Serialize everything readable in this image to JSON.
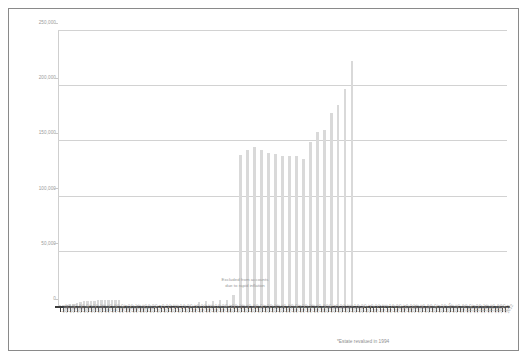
{
  "chart_data": {
    "type": "bar",
    "title": "",
    "subtitle": "",
    "xlabel": "",
    "ylabel": "",
    "ylim": [
      0,
      250000
    ],
    "grid": true,
    "legend_position": "none",
    "ytick_labels": [
      "250,000",
      "200,000",
      "150,000",
      "100,000",
      "50,000",
      "0"
    ],
    "ytick_values": [
      250000,
      200000,
      150000,
      100000,
      50000,
      0
    ],
    "annotations": [
      {
        "name": "excluded-years-note",
        "line1": "Excluded from accounts",
        "line2": "due to rapid inflation"
      },
      {
        "name": "revaluation-footnote",
        "text": "*Estate revalued in 1994"
      }
    ],
    "bar_color": "#d9d9d9",
    "gridline_color": "#d2d2d2",
    "axis_color": "#3b3b3b",
    "label_color": "#9a9a9a",
    "categories": [
      "1884",
      "1885",
      "1886",
      "1887",
      "1888",
      "1889",
      "1890",
      "1891",
      "1892",
      "1893",
      "1894",
      "1895",
      "1896",
      "1897",
      "1898",
      "1899",
      "1900",
      "1901",
      "1902",
      "1903",
      "1904",
      "1905",
      "1906",
      "1907",
      "1908",
      "1909",
      "1910",
      "1911",
      "1912",
      "1913",
      "1914",
      "1915",
      "1916",
      "1917",
      "1918",
      "1919",
      "1920",
      "1921",
      "1922",
      "1923",
      "1924",
      "1925",
      "1926",
      "1927",
      "1928",
      "1929",
      "1930",
      "1931",
      "1932",
      "1933",
      "1934",
      "1935",
      "1936",
      "1937",
      "1938",
      "1939",
      "1940",
      "1941",
      "1942",
      "1943",
      "1944",
      "1945",
      "1946",
      "1947",
      "1948",
      "1949",
      "1950",
      "1951",
      "1952",
      "1953",
      "1954",
      "1955",
      "1956",
      "1957",
      "1958",
      "1959",
      "1960",
      "1961",
      "1962",
      "1963",
      "1964",
      "1965",
      "1966",
      "1967",
      "1968",
      "1969",
      "1970",
      "1971",
      "1972",
      "1973",
      "1974",
      "1975",
      "1976",
      "1977",
      "1978",
      "1979",
      "1980",
      "1981",
      "1982",
      "1983",
      "1984",
      "1985",
      "1986",
      "1987",
      "1988",
      "1989",
      "1990",
      "1991",
      "1992",
      "1993",
      "1994*",
      "1995",
      "1996",
      "1997",
      "1998",
      "1999",
      "2000",
      "2001",
      "2002",
      "2003",
      "2004",
      "2005",
      "2006",
      "2007",
      "2008",
      "2009",
      "2010",
      "2011",
      "2012"
    ],
    "values": [
      300,
      500,
      700,
      1100,
      1600,
      2200,
      2800,
      3600,
      4200,
      4400,
      4900,
      4900,
      5300,
      5600,
      5800,
      5900,
      5700,
      5500,
      5900,
      null,
      null,
      null,
      null,
      null,
      null,
      null,
      null,
      null,
      null,
      null,
      null,
      null,
      null,
      null,
      null,
      null,
      null,
      null,
      null,
      null,
      null,
      null,
      null,
      null,
      null,
      null,
      null,
      null,
      null,
      null,
      3500,
      4100,
      4300,
      4800,
      5600,
      9800,
      137000,
      141000,
      144000,
      141000,
      139000,
      138000,
      136000,
      136000,
      136000,
      133000,
      149000,
      158000,
      159000,
      175000,
      182000,
      197000,
      222000,
      null,
      null,
      null,
      null,
      null,
      null,
      null,
      null,
      null,
      null,
      null,
      null,
      null,
      null,
      null,
      null,
      null,
      null,
      null,
      null,
      null,
      null,
      null,
      null,
      null,
      null,
      null,
      null,
      null,
      null,
      null,
      null,
      null,
      null,
      null,
      null,
      null,
      null,
      null,
      null,
      null,
      null,
      null,
      null,
      null,
      null,
      null,
      null,
      null,
      null,
      null,
      null,
      null,
      null,
      null,
      null
    ]
  },
  "bars": [
    {
      "i": 0,
      "v": 300
    },
    {
      "i": 1,
      "v": 500
    },
    {
      "i": 2,
      "v": 800
    },
    {
      "i": 3,
      "v": 1400
    },
    {
      "i": 4,
      "v": 2000
    },
    {
      "i": 5,
      "v": 2600
    },
    {
      "i": 6,
      "v": 3300
    },
    {
      "i": 7,
      "v": 4100
    },
    {
      "i": 8,
      "v": 4400
    },
    {
      "i": 9,
      "v": 4800
    },
    {
      "i": 10,
      "v": 4900
    },
    {
      "i": 11,
      "v": 5200
    },
    {
      "i": 12,
      "v": 5500
    },
    {
      "i": 13,
      "v": 5700
    },
    {
      "i": 14,
      "v": 5900
    },
    {
      "i": 15,
      "v": 5700
    },
    {
      "i": 16,
      "v": 5500
    },
    {
      "i": 17,
      "v": 5900
    },
    {
      "i": 40,
      "v": 3500
    },
    {
      "i": 42,
      "v": 4200
    },
    {
      "i": 44,
      "v": 4500
    },
    {
      "i": 46,
      "v": 5000
    },
    {
      "i": 48,
      "v": 5800
    },
    {
      "i": 50,
      "v": 9800
    },
    {
      "i": 52,
      "v": 137000
    },
    {
      "i": 54,
      "v": 141000
    },
    {
      "i": 56,
      "v": 144000
    },
    {
      "i": 58,
      "v": 141000
    },
    {
      "i": 60,
      "v": 139000
    },
    {
      "i": 62,
      "v": 138000
    },
    {
      "i": 64,
      "v": 136000
    },
    {
      "i": 66,
      "v": 136000
    },
    {
      "i": 68,
      "v": 136000
    },
    {
      "i": 70,
      "v": 133000
    },
    {
      "i": 72,
      "v": 149000
    },
    {
      "i": 74,
      "v": 158000
    },
    {
      "i": 76,
      "v": 159000
    },
    {
      "i": 78,
      "v": 175000
    },
    {
      "i": 80,
      "v": 182000
    },
    {
      "i": 82,
      "v": 197000
    },
    {
      "i": 84,
      "v": 222000
    }
  ],
  "axis_year_labels": [
    "1884",
    "1885",
    "1886",
    "1887",
    "1888",
    "1889",
    "1890",
    "1891",
    "1892",
    "1893",
    "1894",
    "1895",
    "1896",
    "1897",
    "1898",
    "1899",
    "1900",
    "1901",
    "1902",
    "1903",
    "1904",
    "1905",
    "1906",
    "1907",
    "1908",
    "1909",
    "1910",
    "1911",
    "1912",
    "1913",
    "1914",
    "1915",
    "1916",
    "1917",
    "1918",
    "1919",
    "1920",
    "1921",
    "1922",
    "1923",
    "1924",
    "1925",
    "1926",
    "1927",
    "1928",
    "1929",
    "1930",
    "1931",
    "1932",
    "1933",
    "1934",
    "1935",
    "1936",
    "1937",
    "1938",
    "1939",
    "1940",
    "1941",
    "1942",
    "1943",
    "1944",
    "1945",
    "1946",
    "1947",
    "1948",
    "1949",
    "1950",
    "1951",
    "1952",
    "1953",
    "1954",
    "1955",
    "1956",
    "1957",
    "1958",
    "1959",
    "1960",
    "1961",
    "1962",
    "1963",
    "1964",
    "1965",
    "1966",
    "1967",
    "1968",
    "1969",
    "1970",
    "1971",
    "1972",
    "1973",
    "1974",
    "1975",
    "1976",
    "1977",
    "1978",
    "1979",
    "1980",
    "1981",
    "1982",
    "1983",
    "1984",
    "1985",
    "1986",
    "1987",
    "1988",
    "1989",
    "1990",
    "1991",
    "1992",
    "1993",
    "1994*",
    "1995",
    "1996",
    "1997",
    "1998",
    "1999",
    "2000",
    "2001",
    "2002",
    "2003",
    "2004",
    "2005",
    "2006",
    "2007",
    "2008",
    "2009",
    "2010",
    "2011",
    "2012"
  ],
  "notes": {
    "excluded_line1": "Excluded from accounts",
    "excluded_line2": "due to rapid inflation",
    "footnote": "*Estate revalued in 1994"
  }
}
